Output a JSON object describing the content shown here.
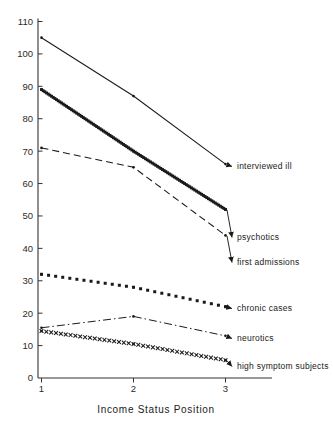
{
  "chart_data": {
    "type": "line",
    "title": "",
    "xlabel": "Income Status Position",
    "ylabel": "",
    "categories": [
      "1",
      "2",
      "3"
    ],
    "x": [
      1,
      2,
      3
    ],
    "xlim": [
      0.72,
      3.5
    ],
    "ylim": [
      0,
      110
    ],
    "yticks": [
      0,
      10,
      20,
      30,
      40,
      50,
      60,
      70,
      80,
      90,
      100,
      110
    ],
    "ytick_labels": [
      "0",
      "10",
      "20",
      "30",
      "40",
      "50",
      "60",
      "70",
      "80",
      "90",
      "100",
      "110"
    ],
    "xticks": [
      1,
      2,
      3
    ],
    "xtick_labels": [
      "1",
      "2",
      "3"
    ],
    "grid": false,
    "legend_position": "right-inline-annotations",
    "series": [
      {
        "name": "interviewed ill",
        "label": "interviewed ill",
        "values": [
          105,
          87,
          66
        ],
        "style": "solid",
        "color": "#1a1a1a"
      },
      {
        "name": "psychotics",
        "label": "psychotics",
        "values": [
          89,
          70,
          52
        ],
        "style": "thick-dotted",
        "color": "#1a1a1a"
      },
      {
        "name": "first admissions",
        "label": "first admissions",
        "values": [
          71,
          65,
          44
        ],
        "style": "dashed",
        "color": "#1a1a1a"
      },
      {
        "name": "chronic cases",
        "label": "chronic cases",
        "values": [
          32,
          28,
          22
        ],
        "style": "dotted",
        "color": "#1a1a1a"
      },
      {
        "name": "neurotics",
        "label": "neurotics",
        "values": [
          15.5,
          19,
          13
        ],
        "style": "dash-dot",
        "color": "#1a1a1a"
      },
      {
        "name": "high symptom subjects",
        "label": "high symptom subjects",
        "values": [
          14.5,
          10.5,
          5.5
        ],
        "style": "x-marker",
        "color": "#1a1a1a"
      }
    ]
  },
  "axis": {
    "x_title": "Income Status Position"
  }
}
